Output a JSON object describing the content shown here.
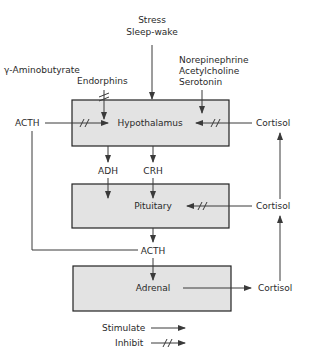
{
  "diagram": {
    "boxes": {
      "hypothalamus": "Hypothalamus",
      "pituitary": "Pituitary",
      "adrenal": "Adrenal"
    },
    "inputs": {
      "stress_line1": "Stress",
      "stress_line2": "Sleep-wake",
      "gaba": "γ-Aminobutyrate",
      "endorphins": "Endorphins",
      "norepinephrine": "Norepinephrine",
      "acetylcholine": "Acetylcholine",
      "serotonin": "Serotonin"
    },
    "hormones": {
      "acth_left": "ACTH",
      "acth_mid": "ACTH",
      "adh": "ADH",
      "crh": "CRH",
      "cortisol_top": "Cortisol",
      "cortisol_mid": "Cortisol",
      "cortisol_bottom": "Cortisol"
    },
    "legend": {
      "stimulate": "Stimulate",
      "inhibit": "Inhibit"
    },
    "colors": {
      "box_fill": "#e3e3e3",
      "line": "#3a3a3a"
    }
  }
}
